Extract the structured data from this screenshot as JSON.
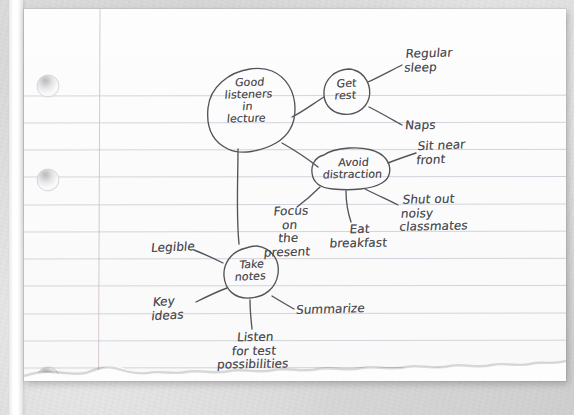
{
  "page": {
    "medium": "three-hole-punched ruled notebook paper",
    "torn_edge": "bottom",
    "hole_count_visible": 3,
    "rule_color": "#c9ced6",
    "margin_line_color": "#c9b7c4",
    "ink_color": "#4a4a50",
    "paper_color": "#fdfdfd",
    "desk_color": "#d6d6d6"
  },
  "mindmap": {
    "title": "Good listeners in lecture",
    "root": {
      "id": "root",
      "label": "Good\nlisteners\nin\nlecture"
    },
    "nodes": [
      {
        "id": "get-rest",
        "label": "Get\nrest"
      },
      {
        "id": "avoid-distraction",
        "label": "Avoid\ndistraction"
      },
      {
        "id": "take-notes",
        "label": "Take\nnotes"
      }
    ],
    "leaves": [
      {
        "id": "regular-sleep",
        "parent": "get-rest",
        "label": "Regular\nsleep"
      },
      {
        "id": "naps",
        "parent": "get-rest",
        "label": "Naps"
      },
      {
        "id": "sit-near-front",
        "parent": "avoid-distraction",
        "label": "Sit near\nfront"
      },
      {
        "id": "shut-out-noisy",
        "parent": "avoid-distraction",
        "label": "Shut out\nnoisy\nclassmates"
      },
      {
        "id": "eat-breakfast",
        "parent": "avoid-distraction",
        "label": "Eat\nbreakfast"
      },
      {
        "id": "focus-present",
        "parent": "avoid-distraction",
        "label": "Focus\non\nthe\npresent"
      },
      {
        "id": "legible",
        "parent": "take-notes",
        "label": "Legible"
      },
      {
        "id": "key-ideas",
        "parent": "take-notes",
        "label": "Key\nideas"
      },
      {
        "id": "listen-for-test",
        "parent": "take-notes",
        "label": "Listen\nfor test\npossibilities"
      },
      {
        "id": "summarize",
        "parent": "take-notes",
        "label": "Summarize"
      }
    ]
  }
}
